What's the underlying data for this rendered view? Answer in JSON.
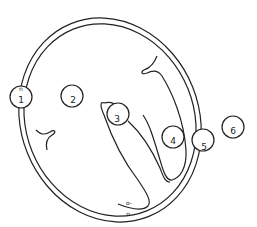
{
  "diagram": {
    "line_color": "#222222",
    "background": "#ffffff",
    "markers": [
      {
        "id": 1,
        "label": "1",
        "sublabel": "n"
      },
      {
        "id": 2,
        "label": "2"
      },
      {
        "id": 3,
        "label": "3"
      },
      {
        "id": 4,
        "label": "4"
      },
      {
        "id": 5,
        "label": "5"
      },
      {
        "id": 6,
        "label": "6"
      }
    ],
    "bottom_labels": {
      "upper": "o-",
      "lower": "o"
    }
  }
}
